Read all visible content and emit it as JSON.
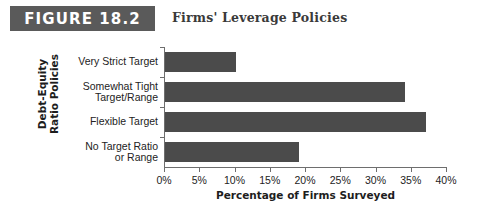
{
  "header": {
    "badge_label": "FIGURE 18.2",
    "title": "Firms' Leverage Policies",
    "badge_color": "#5a5a5a",
    "badge_text_color": "#ffffff",
    "title_color": "#3a3a3a"
  },
  "chart_data": {
    "type": "bar",
    "orientation": "horizontal",
    "title": "Firms' Leverage Policies",
    "categories": [
      "Very Strict Target",
      "Somewhat Tight\nTarget/Range",
      "Flexible Target",
      "No Target Ratio\nor Range"
    ],
    "values": [
      10,
      34,
      37,
      19
    ],
    "xlabel": "Percentage of Firms Surveyed",
    "ylabel": "Debt-Equity\nRatio Policies",
    "xlim": [
      0,
      40
    ],
    "xticks": [
      0,
      5,
      10,
      15,
      20,
      25,
      30,
      35,
      40
    ],
    "xtick_labels": [
      "0%",
      "5%",
      "10%",
      "15%",
      "20%",
      "25%",
      "30%",
      "35%",
      "40%"
    ],
    "grid": false,
    "legend": false,
    "bar_color": "#4b4b4b",
    "axis_color": "#6e6e6e"
  }
}
